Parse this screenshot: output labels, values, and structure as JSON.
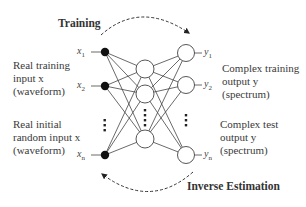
{
  "diagram": {
    "type": "neural-network",
    "arrows": {
      "top_label": "Training",
      "bottom_label": "Inverse Estimation"
    },
    "left_labels": {
      "training_input": [
        "Real training",
        "input x",
        "(waveform)"
      ],
      "random_input": [
        "Real initial",
        "random input x",
        "(waveform)"
      ]
    },
    "right_labels": {
      "training_output": [
        "Complex training",
        "output y",
        "(spectrum)"
      ],
      "test_output": [
        "Complex test",
        "output y",
        "(spectrum)"
      ]
    },
    "inputs": [
      {
        "name": "x",
        "sub": "1"
      },
      {
        "name": "x",
        "sub": "2"
      },
      {
        "name": "x",
        "sub": "n"
      }
    ],
    "outputs": [
      {
        "name": "y",
        "sub": "1"
      },
      {
        "name": "y",
        "sub": "2"
      },
      {
        "name": "y",
        "sub": "n"
      }
    ],
    "colors": {
      "input_node": "#111111",
      "edge": "#333333",
      "node_outline": "#444444",
      "text": "#3a3a3a"
    }
  }
}
